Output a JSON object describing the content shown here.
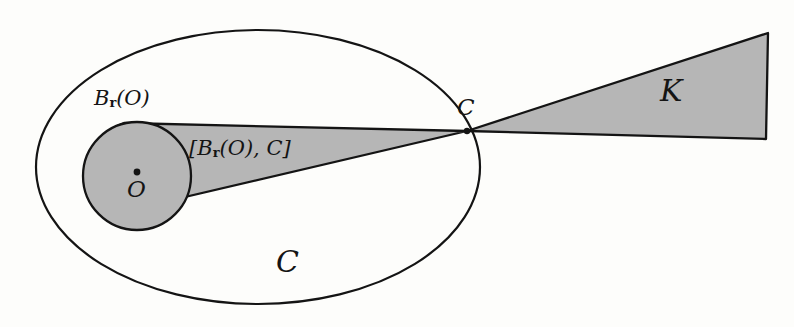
{
  "figure": {
    "background_color": "#fdfdfb",
    "stroke_color": "#141414",
    "shade_color": "#b6b6b6",
    "labels": {
      "ball": {
        "main": "B",
        "subscript": "r",
        "argument": "(O)"
      },
      "hull": {
        "open": "[",
        "main": "B",
        "subscript": "r",
        "argument": "(O)",
        "separator": ", ",
        "apex": "C",
        "close": "]"
      },
      "origin": "O",
      "apex": "C",
      "cone": "K",
      "body": "C"
    },
    "geometry": {
      "body_ellipse": {
        "cx": 258,
        "cy": 167,
        "rx": 222,
        "ry": 137
      },
      "ball_circle": {
        "cx": 137,
        "cy": 176,
        "r": 54
      },
      "apex_point": {
        "x": 467,
        "y": 131
      },
      "origin_point": {
        "x": 137,
        "y": 172
      },
      "cone_far_top": {
        "x": 768,
        "y": 33
      },
      "cone_far_bottom": {
        "x": 766,
        "y": 139
      }
    }
  }
}
